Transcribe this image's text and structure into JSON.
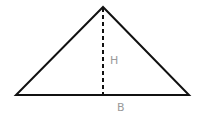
{
  "diagram": {
    "type": "triangle",
    "vertices": {
      "apex": [
        103,
        7
      ],
      "base_left": [
        16,
        95
      ],
      "base_right": [
        189,
        95
      ]
    },
    "height_line": {
      "from": [
        103,
        7
      ],
      "to": [
        103,
        95
      ],
      "style": "dashed"
    },
    "labels": {
      "height": "H",
      "base": "B"
    },
    "colors": {
      "stroke": "#111111",
      "label": "#9a9a9a",
      "background": "#ffffff"
    }
  }
}
